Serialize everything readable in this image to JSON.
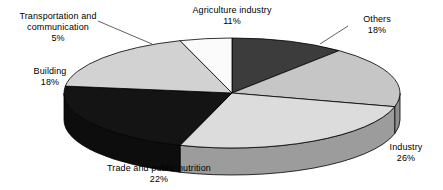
{
  "chart_data": {
    "type": "pie",
    "title": "",
    "subtitle": "",
    "xlabel": "",
    "ylabel": "",
    "legend_position": "none",
    "grid": false,
    "three_d": true,
    "start_angle_deg": -90,
    "direction": "clockwise",
    "unit": "%",
    "categories": [
      "Agriculture industry",
      "Others",
      "Industry",
      "Trade and public nutrition",
      "Building",
      "Transportation and communication"
    ],
    "values": [
      11,
      18,
      26,
      22,
      18,
      5
    ],
    "slices": [
      {
        "label": "Agriculture industry",
        "value": 11,
        "percent_text": "11%",
        "top_color": "#3c3c3c",
        "side_color": "#2a2a2a",
        "label_align": "center"
      },
      {
        "label": "Others",
        "value": 18,
        "percent_text": "18%",
        "top_color": "#c6c6c6",
        "side_color": "#8e8e8e",
        "label_align": "center"
      },
      {
        "label": "Industry",
        "value": 26,
        "percent_text": "26%",
        "top_color": "#dcdcdc",
        "side_color": "#9c9c9c",
        "label_align": "center"
      },
      {
        "label": "Trade and public nutrition",
        "value": 22,
        "percent_text": "22%",
        "top_color": "#141414",
        "side_color": "#0d0d0d",
        "label_align": "center"
      },
      {
        "label": "Building",
        "value": 18,
        "percent_text": "18%",
        "top_color": "#d2d2d2",
        "side_color": "#979797",
        "label_align": "center"
      },
      {
        "label": "Transportation and communication",
        "value": 5,
        "percent_text": "5%",
        "top_color": "#fbfbfb",
        "side_color": "#c0c0c0",
        "label_align": "center"
      }
    ],
    "geometry": {
      "center_x": 232,
      "center_y": 93,
      "radius_x": 168,
      "radius_y": 55,
      "depth": 27,
      "stroke": "#000000",
      "stroke_width": 0.8
    },
    "leaders": [
      {
        "name": "others-leader",
        "x1": 348,
        "y1": 26,
        "x2": 320,
        "y2": 44
      },
      {
        "name": "transport-leader",
        "x1": 98,
        "y1": 21,
        "x2": 152,
        "y2": 44
      }
    ]
  },
  "labels": {
    "agriculture": {
      "name": "Agriculture industry",
      "percent": "11%"
    },
    "others": {
      "name": "Others",
      "percent": "18%"
    },
    "industry": {
      "name": "Industry",
      "percent": "26%"
    },
    "trade": {
      "name": "Trade and public nutrition",
      "percent": "22%"
    },
    "building": {
      "name": "Building",
      "percent": "18%"
    },
    "transport": {
      "name": "Transportation and communication",
      "percent": "5%",
      "line1": "Transportation and",
      "line2": "communication"
    }
  }
}
